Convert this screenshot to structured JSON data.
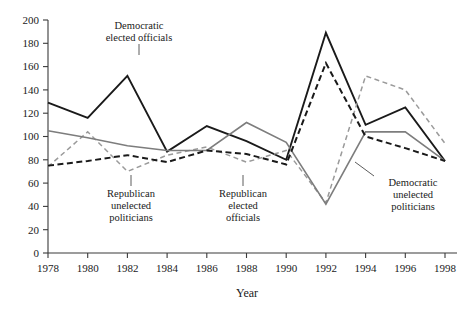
{
  "chart_data": {
    "type": "line",
    "title": "",
    "xlabel": "Year",
    "ylabel": "",
    "xlim": [
      1978,
      1998
    ],
    "ylim": [
      0,
      200
    ],
    "grid": false,
    "legend_position": "inline-annotations",
    "categories": [
      1978,
      1980,
      1982,
      1984,
      1986,
      1988,
      1990,
      1992,
      1994,
      1996,
      1998
    ],
    "x_tick_labels": [
      "1978",
      "1980",
      "1982",
      "1984",
      "1986",
      "1988",
      "1990",
      "1992",
      "1994",
      "1996",
      "1998"
    ],
    "y_tick_labels": [
      "0",
      "20",
      "40",
      "60",
      "80",
      "100",
      "120",
      "140",
      "160",
      "180",
      "200"
    ],
    "y_ticks": [
      0,
      20,
      40,
      60,
      80,
      100,
      120,
      140,
      160,
      180,
      200
    ],
    "series": [
      {
        "name": "Democratic elected officials",
        "style": "solid",
        "color": "#1a1a1a",
        "width": 1.9,
        "values": [
          129,
          116,
          152,
          87,
          109,
          96,
          80,
          189,
          110,
          125,
          79
        ]
      },
      {
        "name": "Republican unelected politicians",
        "style": "dashed",
        "color": "#9a9a9a",
        "width": 1.5,
        "values": [
          74,
          104,
          70,
          84,
          91,
          78,
          88,
          43,
          152,
          140,
          94
        ]
      },
      {
        "name": "Republican elected officials",
        "style": "solid",
        "color": "#7d7d7d",
        "width": 1.6,
        "values": [
          105,
          99,
          92,
          88,
          88,
          112,
          95,
          42,
          104,
          104,
          79
        ]
      },
      {
        "name": "Democratic unelected politicians",
        "style": "dashed",
        "color": "#1a1a1a",
        "width": 2.0,
        "values": [
          75,
          79,
          84,
          78,
          88,
          85,
          76,
          163,
          100,
          90,
          79
        ]
      }
    ],
    "annotations": [
      {
        "id": "democratic-elected-officials",
        "lines": [
          "Democratic",
          "elected officials"
        ],
        "text_x": 139,
        "text_y": 29,
        "leader": {
          "x1": 139,
          "y1": 44,
          "x2": 139,
          "y2": 55
        }
      },
      {
        "id": "republican-unelected-politicians",
        "lines": [
          "Republican",
          "unelected",
          "politicians"
        ],
        "text_x": 131,
        "text_y": 197,
        "leader": {
          "x1": 131,
          "y1": 175,
          "x2": 131,
          "y2": 186
        }
      },
      {
        "id": "republican-elected-officials",
        "lines": [
          "Republican",
          "elected",
          "officials"
        ],
        "text_x": 243,
        "text_y": 197,
        "leader": {
          "x1": 243,
          "y1": 175,
          "x2": 243,
          "y2": 186
        }
      },
      {
        "id": "democratic-unelected-politicians",
        "lines": [
          "Democratic",
          "unelected",
          "politicians"
        ],
        "text_x": 413,
        "text_y": 186,
        "leader": {
          "x1": 355,
          "y1": 162,
          "x2": 374,
          "y2": 176
        }
      }
    ]
  },
  "axis": {
    "x_title": "Year"
  }
}
